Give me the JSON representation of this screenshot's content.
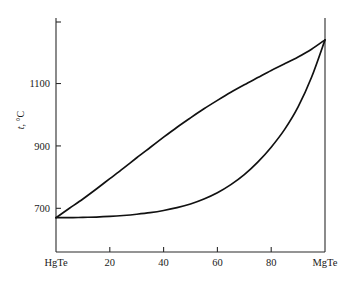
{
  "chart_data": {
    "type": "line",
    "title": "",
    "subtitle": "",
    "xlabel": "",
    "ylabel": "t, °C",
    "ylabel_symbol": "t",
    "ylabel_unit": ", °C",
    "xlim": [
      0,
      100
    ],
    "ylim": [
      560,
      1310
    ],
    "grid": false,
    "legend": "none",
    "x_tick_values": [
      0,
      20,
      40,
      60,
      80,
      100
    ],
    "x_tick_labels": [
      "HgTe",
      "20",
      "40",
      "60",
      "80",
      "MgTe"
    ],
    "y_tick_values": [
      700,
      900,
      1100
    ],
    "y_tick_labels": [
      "700",
      "900",
      "1100"
    ],
    "series": [
      {
        "name": "liquidus",
        "x": [
          0,
          5,
          10,
          15,
          20,
          25,
          30,
          35,
          40,
          45,
          50,
          55,
          60,
          65,
          70,
          75,
          80,
          85,
          90,
          95,
          100
        ],
        "values": [
          670,
          700,
          730,
          762,
          795,
          828,
          862,
          895,
          928,
          960,
          990,
          1019,
          1046,
          1072,
          1096,
          1119,
          1142,
          1163,
          1185,
          1210,
          1240
        ]
      },
      {
        "name": "solidus",
        "x": [
          0,
          5,
          10,
          15,
          20,
          25,
          30,
          35,
          40,
          45,
          50,
          55,
          60,
          65,
          70,
          75,
          80,
          85,
          90,
          95,
          100
        ],
        "values": [
          670,
          670,
          671,
          672,
          674,
          677,
          681,
          686,
          693,
          702,
          714,
          730,
          750,
          776,
          808,
          848,
          896,
          953,
          1025,
          1120,
          1240
        ]
      }
    ],
    "annotations": []
  },
  "colors": {
    "curve": "#111111",
    "axis": "#2b2b2b",
    "background": "#ffffff"
  }
}
